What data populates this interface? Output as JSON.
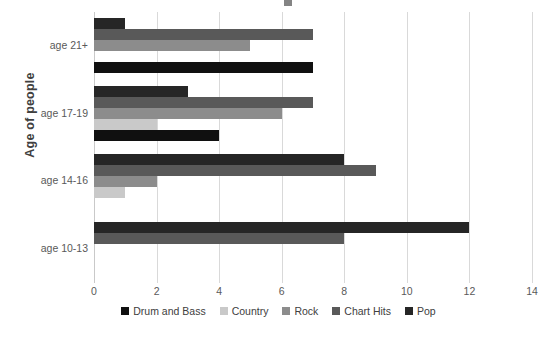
{
  "chart_data": {
    "type": "bar",
    "orientation": "horizontal",
    "title": "",
    "xlabel": "",
    "ylabel": "Age of people",
    "categories": [
      "age 10-13",
      "age 14-16",
      "age 17-19",
      "age 21+"
    ],
    "xlim": [
      0,
      14
    ],
    "xticks": [
      0,
      2,
      4,
      6,
      8,
      10,
      12,
      14
    ],
    "xtick_labels": [
      "0",
      "2",
      "4",
      "6",
      "8",
      "10",
      "12",
      "14"
    ],
    "grid": true,
    "legend_position": "bottom",
    "series": [
      {
        "name": "Drum and Bass",
        "color": "#101010",
        "values": [
          0,
          0,
          4,
          7
        ]
      },
      {
        "name": "Country",
        "color": "#c9c9c9",
        "values": [
          0,
          1,
          2,
          0
        ]
      },
      {
        "name": "Rock",
        "color": "#8c8c8c",
        "values": [
          0,
          2,
          6,
          5
        ]
      },
      {
        "name": "Chart Hits",
        "color": "#595959",
        "values": [
          8,
          9,
          7,
          7
        ]
      },
      {
        "name": "Pop",
        "color": "#262626",
        "values": [
          12,
          8,
          3,
          1
        ]
      }
    ]
  },
  "axis": {
    "y_title": "Age of people"
  }
}
